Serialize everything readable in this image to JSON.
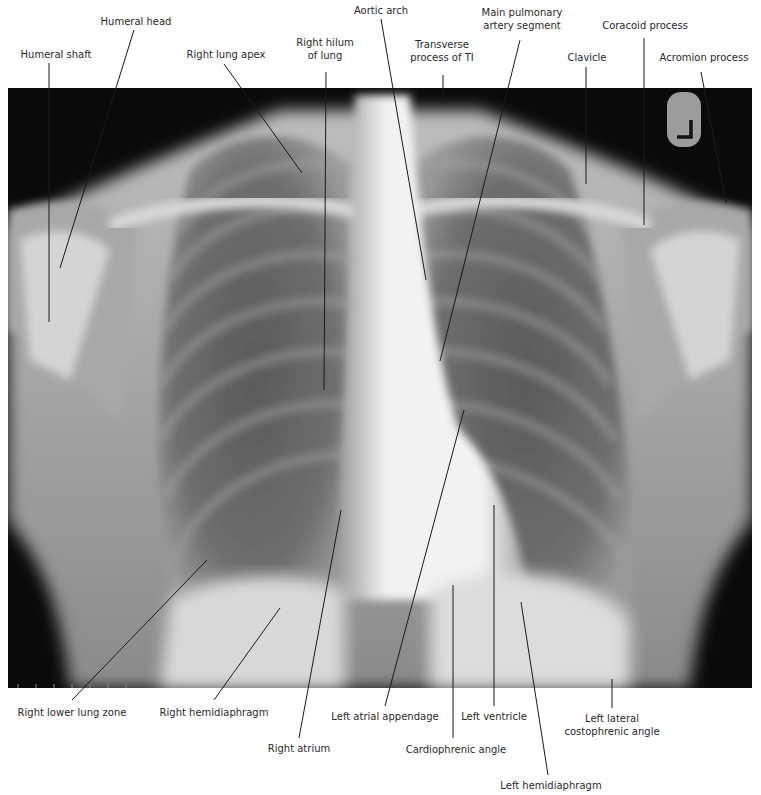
{
  "figure": {
    "type": "Chest radiograph (PA view) with anatomical labels",
    "marker": "L",
    "labels": [
      {
        "id": "humeral-shaft",
        "text": "Humeral shaft",
        "x": 56,
        "y": 54,
        "anchor": [
          49,
          63
        ],
        "target": [
          49,
          322
        ]
      },
      {
        "id": "humeral-head",
        "text": "Humeral head",
        "x": 136,
        "y": 21,
        "anchor": [
          134,
          30
        ],
        "target": [
          60,
          268
        ]
      },
      {
        "id": "right-lung-apex",
        "text": "Right lung apex",
        "x": 226,
        "y": 54,
        "anchor": [
          224,
          64
        ],
        "target": [
          302,
          173
        ]
      },
      {
        "id": "right-hilum",
        "text": "Right hilum\nof lung",
        "x": 325,
        "y": 42,
        "anchor": [
          326,
          72
        ],
        "target": [
          324,
          390
        ]
      },
      {
        "id": "aortic-arch",
        "text": "Aortic arch",
        "x": 381,
        "y": 10,
        "anchor": [
          381,
          19
        ],
        "target": [
          426,
          280
        ]
      },
      {
        "id": "transverse-process",
        "text": "Transverse\nprocess of TI",
        "x": 442,
        "y": 44,
        "anchor": [
          443,
          75
        ],
        "target": [
          443,
          103
        ]
      },
      {
        "id": "main-pulmonary",
        "text": "Main pulmonary\nartery segment",
        "x": 522,
        "y": 12,
        "anchor": [
          520,
          40
        ],
        "target": [
          440,
          361
        ]
      },
      {
        "id": "clavicle",
        "text": "Clavicle",
        "x": 587,
        "y": 57,
        "anchor": [
          586,
          67
        ],
        "target": [
          586,
          184
        ]
      },
      {
        "id": "coracoid",
        "text": "Coracoid process",
        "x": 645,
        "y": 25,
        "anchor": [
          644,
          38
        ],
        "target": [
          644,
          225
        ]
      },
      {
        "id": "acromion",
        "text": "Acromion process",
        "x": 704,
        "y": 57,
        "anchor": [
          701,
          72
        ],
        "target": [
          726,
          203
        ]
      },
      {
        "id": "right-lower-lung",
        "text": "Right lower lung zone",
        "x": 72,
        "y": 712,
        "anchor": [
          72,
          700
        ],
        "target": [
          207,
          560
        ]
      },
      {
        "id": "right-hemidiaphragm",
        "text": "Right hemidiaphragm",
        "x": 214,
        "y": 712,
        "anchor": [
          214,
          700
        ],
        "target": [
          280,
          608
        ]
      },
      {
        "id": "right-atrium",
        "text": "Right atrium",
        "x": 299,
        "y": 748,
        "anchor": [
          299,
          738
        ],
        "target": [
          341,
          510
        ]
      },
      {
        "id": "left-atrial-appendage",
        "text": "Left atrial appendage",
        "x": 385,
        "y": 716,
        "anchor": [
          385,
          706
        ],
        "target": [
          464,
          410
        ]
      },
      {
        "id": "cardiophrenic",
        "text": "Cardiophrenic angle",
        "x": 456,
        "y": 749,
        "anchor": [
          453,
          738
        ],
        "target": [
          453,
          585
        ]
      },
      {
        "id": "left-ventricle",
        "text": "Left ventricle",
        "x": 494,
        "y": 716,
        "anchor": [
          494,
          706
        ],
        "target": [
          494,
          505
        ]
      },
      {
        "id": "left-hemidiaphragm",
        "text": "Left hemidiaphragm",
        "x": 551,
        "y": 785,
        "anchor": [
          548,
          775
        ],
        "target": [
          521,
          602
        ]
      },
      {
        "id": "left-costophrenic",
        "text": "Left lateral\ncostophrenic angle",
        "x": 612,
        "y": 718,
        "anchor": [
          612,
          708
        ],
        "target": [
          612,
          679
        ]
      }
    ]
  },
  "colors": {
    "background": "#ffffff",
    "film_dark": "#0a0a0a",
    "leader": "#1a1a1a",
    "text": "#2a2a2a"
  }
}
